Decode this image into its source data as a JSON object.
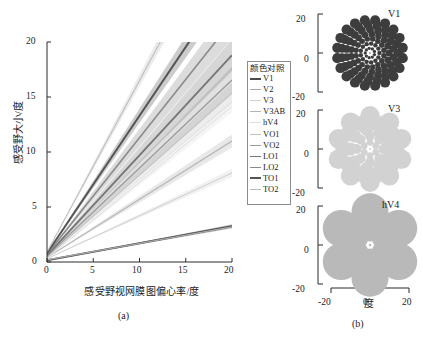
{
  "figure": {
    "caption_a": "(a)",
    "caption_b": "(b)"
  },
  "panel_a": {
    "xlabel": "感受野视网膜图偏心率/度",
    "ylabel": "感受野大小/度",
    "xticks": [
      "0",
      "5",
      "10",
      "15",
      "20"
    ],
    "yticks": [
      "0",
      "5",
      "10",
      "15",
      "20"
    ]
  },
  "legend": {
    "title": "颜色对照",
    "items": [
      {
        "label": "V1",
        "color": "#4a4a4a",
        "width": 2.0
      },
      {
        "label": "V2",
        "color": "#a8a8a8",
        "width": 1.2
      },
      {
        "label": "V3",
        "color": "#cfcfcf",
        "width": 1.0
      },
      {
        "label": "V3AB",
        "color": "#b4b4b4",
        "width": 1.2
      },
      {
        "label": "hV4",
        "color": "#dedede",
        "width": 1.0
      },
      {
        "label": "VO1",
        "color": "#c2c2c2",
        "width": 1.1
      },
      {
        "label": "VO2",
        "color": "#9c9c9c",
        "width": 1.4
      },
      {
        "label": "LO1",
        "color": "#767676",
        "width": 1.8
      },
      {
        "label": "LO2",
        "color": "#8a8a8a",
        "width": 1.6
      },
      {
        "label": "TO1",
        "color": "#555555",
        "width": 2.0
      },
      {
        "label": "TO2",
        "color": "#bdbdbd",
        "width": 1.1
      }
    ]
  },
  "panel_b": {
    "xlabel": "度",
    "subplots": [
      {
        "name": "V1",
        "yticks": [
          "20",
          "0",
          "-20"
        ],
        "dot_color": "#3d3d3d",
        "rings": 7,
        "max_radius": 2.6,
        "min_radius": 0.55
      },
      {
        "name": "V3",
        "yticks": [
          "20",
          "0",
          "-20"
        ],
        "dot_color": "#d2d2d2",
        "rings": 5,
        "max_radius": 5.0,
        "min_radius": 0.9
      },
      {
        "name": "hV4",
        "yticks": [
          "20",
          "0",
          "-20"
        ],
        "dot_color": "#b9b9b9",
        "rings": 3,
        "max_radius": 9.5,
        "min_radius": 1.0
      }
    ],
    "xticks": [
      "-20",
      "0",
      "20"
    ]
  },
  "chart_data": {
    "type": "line",
    "title": "",
    "xlabel": "感受野视网膜图偏心率/度",
    "ylabel": "感受野大小/度",
    "xlim": [
      0,
      20
    ],
    "ylim": [
      0,
      20
    ],
    "xticks": [
      0,
      5,
      10,
      15,
      20
    ],
    "yticks": [
      0,
      5,
      10,
      15,
      20
    ],
    "grid": false,
    "legend_position": "right",
    "x": [
      0,
      20
    ],
    "series": [
      {
        "name": "V1",
        "intercept": 0.15,
        "slope": 0.155,
        "values": [
          0.15,
          3.25
        ],
        "band": 0.18,
        "color": "#4a4a4a",
        "width": 2.0
      },
      {
        "name": "V2",
        "intercept": 0.2,
        "slope": 0.15,
        "values": [
          0.2,
          3.2
        ],
        "band": 0.16,
        "color": "#a8a8a8",
        "width": 1.2
      },
      {
        "name": "V3",
        "intercept": 0.3,
        "slope": 0.39,
        "values": [
          0.3,
          8.1
        ],
        "band": 0.35,
        "color": "#cfcfcf",
        "width": 1.0
      },
      {
        "name": "V3AB",
        "intercept": 0.4,
        "slope": 0.53,
        "values": [
          0.4,
          11.0
        ],
        "band": 0.6,
        "color": "#b4b4b4",
        "width": 1.2
      },
      {
        "name": "hV4",
        "intercept": 0.35,
        "slope": 0.69,
        "values": [
          0.35,
          14.15
        ],
        "band": 0.55,
        "color": "#dedede",
        "width": 1.0
      },
      {
        "name": "VO1",
        "intercept": 0.45,
        "slope": 0.745,
        "values": [
          0.45,
          15.35
        ],
        "band": 0.95,
        "color": "#c2c2c2",
        "width": 1.1
      },
      {
        "name": "VO2",
        "intercept": 0.55,
        "slope": 0.8,
        "values": [
          0.55,
          16.55
        ],
        "band": 1.2,
        "color": "#9c9c9c",
        "width": 1.4
      },
      {
        "name": "LO1",
        "intercept": 0.6,
        "slope": 0.91,
        "values": [
          0.6,
          18.8
        ],
        "band": 1.45,
        "color": "#767676",
        "width": 1.8
      },
      {
        "name": "LO2",
        "intercept": 0.7,
        "slope": 1.06,
        "values": [
          0.7,
          20.0
        ],
        "band": 1.6,
        "color": "#8a8a8a",
        "width": 1.6
      },
      {
        "name": "TO1",
        "intercept": 0.8,
        "slope": 1.25,
        "values": [
          0.8,
          20.0
        ],
        "band": 1.3,
        "color": "#555555",
        "width": 2.0
      },
      {
        "name": "TO2",
        "intercept": 0.9,
        "slope": 1.56,
        "values": [
          0.9,
          20.0
        ],
        "band": 1.1,
        "color": "#bdbdbd",
        "width": 1.1
      }
    ]
  }
}
